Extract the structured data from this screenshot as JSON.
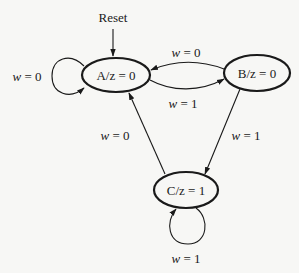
{
  "diagram": {
    "type": "moore-state-machine",
    "reset_label": "Reset",
    "states": [
      {
        "id": "A",
        "label": "A/z = 0",
        "output": 0
      },
      {
        "id": "B",
        "label": "B/z = 0",
        "output": 0
      },
      {
        "id": "C",
        "label": "C/z = 1",
        "output": 1
      }
    ],
    "transitions": [
      {
        "from": "A",
        "to": "A",
        "var": "w",
        "eq": " = 0",
        "label": "w = 0"
      },
      {
        "from": "B",
        "to": "A",
        "var": "w",
        "eq": " = 0",
        "label": "w = 0"
      },
      {
        "from": "A",
        "to": "B",
        "var": "w",
        "eq": " = 1",
        "label": "w = 1"
      },
      {
        "from": "B",
        "to": "C",
        "var": "w",
        "eq": " = 1",
        "label": "w = 1"
      },
      {
        "from": "C",
        "to": "A",
        "var": "w",
        "eq": " = 0",
        "label": "w = 0"
      },
      {
        "from": "C",
        "to": "C",
        "var": "w",
        "eq": " = 1",
        "label": "w = 1"
      }
    ],
    "colors": {
      "stroke": "#1a1a1a",
      "background": "#f7f7f5"
    }
  }
}
